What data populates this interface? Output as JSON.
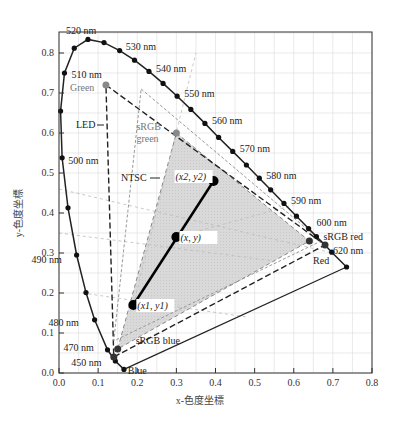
{
  "chart_data": {
    "type": "scatter",
    "title": "",
    "xlabel": "x-色度坐標",
    "ylabel": "y-色度坐標",
    "xlim": [
      0.0,
      0.8
    ],
    "ylim": [
      0.0,
      0.85
    ],
    "grid": true,
    "x_ticks": [
      "0.0",
      "0.1",
      "0.2",
      "0.3",
      "0.4",
      "0.5",
      "0.6",
      "0.7",
      "0.8"
    ],
    "y_ticks": [
      "0.0",
      "0.1",
      "0.2",
      "0.3",
      "0.4",
      "0.5",
      "0.6",
      "0.7",
      "0.8"
    ],
    "spectral_locus": {
      "name": "spectral locus",
      "points": [
        [
          0.166,
          0.009
        ],
        [
          0.144,
          0.03
        ],
        [
          0.124,
          0.058
        ],
        [
          0.091,
          0.133
        ],
        [
          0.069,
          0.201
        ],
        [
          0.045,
          0.295
        ],
        [
          0.023,
          0.413
        ],
        [
          0.008,
          0.538
        ],
        [
          0.004,
          0.655
        ],
        [
          0.014,
          0.75
        ],
        [
          0.039,
          0.812
        ],
        [
          0.074,
          0.834
        ],
        [
          0.115,
          0.826
        ],
        [
          0.155,
          0.806
        ],
        [
          0.193,
          0.782
        ],
        [
          0.23,
          0.754
        ],
        [
          0.266,
          0.724
        ],
        [
          0.302,
          0.692
        ],
        [
          0.337,
          0.659
        ],
        [
          0.373,
          0.624
        ],
        [
          0.408,
          0.589
        ],
        [
          0.444,
          0.554
        ],
        [
          0.479,
          0.52
        ],
        [
          0.512,
          0.487
        ],
        [
          0.541,
          0.458
        ],
        [
          0.575,
          0.424
        ],
        [
          0.607,
          0.392
        ],
        [
          0.638,
          0.361
        ],
        [
          0.658,
          0.341
        ],
        [
          0.68,
          0.32
        ],
        [
          0.697,
          0.302
        ],
        [
          0.735,
          0.265
        ]
      ],
      "wavelength_labels": [
        {
          "label": "450 nm",
          "x": 0.144,
          "y": 0.03
        },
        {
          "label": "470 nm",
          "x": 0.124,
          "y": 0.058
        },
        {
          "label": "480 nm",
          "x": 0.091,
          "y": 0.133
        },
        {
          "label": "490 nm",
          "x": 0.045,
          "y": 0.295
        },
        {
          "label": "500 nm",
          "x": 0.008,
          "y": 0.538
        },
        {
          "label": "510 nm",
          "x": 0.014,
          "y": 0.75
        },
        {
          "label": "520 nm",
          "x": 0.074,
          "y": 0.834
        },
        {
          "label": "530 nm",
          "x": 0.155,
          "y": 0.806
        },
        {
          "label": "540 nm",
          "x": 0.23,
          "y": 0.754
        },
        {
          "label": "550 nm",
          "x": 0.302,
          "y": 0.692
        },
        {
          "label": "560 nm",
          "x": 0.373,
          "y": 0.624
        },
        {
          "label": "570 nm",
          "x": 0.444,
          "y": 0.554
        },
        {
          "label": "580 nm",
          "x": 0.512,
          "y": 0.487
        },
        {
          "label": "590 nm",
          "x": 0.575,
          "y": 0.424
        },
        {
          "label": "600 nm",
          "x": 0.638,
          "y": 0.361
        },
        {
          "label": "620 nm",
          "x": 0.68,
          "y": 0.32
        }
      ]
    },
    "gamuts": [
      {
        "name": "LED",
        "style": "dash-dot",
        "points": [
          [
            0.12,
            0.72
          ],
          [
            0.68,
            0.32
          ],
          [
            0.14,
            0.04
          ]
        ]
      },
      {
        "name": "sRGB",
        "style": "dashed-fill",
        "points": [
          [
            0.3,
            0.6
          ],
          [
            0.64,
            0.33
          ],
          [
            0.15,
            0.06
          ]
        ]
      },
      {
        "name": "NTSC",
        "style": "dashed",
        "points": [
          [
            0.21,
            0.71
          ],
          [
            0.67,
            0.33
          ],
          [
            0.14,
            0.08
          ]
        ]
      }
    ],
    "primaries": [
      {
        "label": "Green",
        "x": 0.12,
        "y": 0.72,
        "gray": true
      },
      {
        "label": "sRGB green",
        "x": 0.3,
        "y": 0.6,
        "gray": true
      },
      {
        "label": "sRGB red",
        "x": 0.64,
        "y": 0.33,
        "gray": false
      },
      {
        "label": "Red",
        "x": 0.68,
        "y": 0.32,
        "gray": false
      },
      {
        "label": "sRGB blue",
        "x": 0.15,
        "y": 0.06,
        "gray": false
      },
      {
        "label": "Blue",
        "x": 0.14,
        "y": 0.04,
        "gray": false
      }
    ],
    "mix_line": {
      "points": [
        {
          "label": "(x2, y2)",
          "x": 0.395,
          "y": 0.48
        },
        {
          "label": "(x, y)",
          "x": 0.3,
          "y": 0.34
        },
        {
          "label": "(x1, y1)",
          "x": 0.19,
          "y": 0.17
        }
      ]
    },
    "annotations": [
      "LED",
      "NTSC"
    ]
  }
}
